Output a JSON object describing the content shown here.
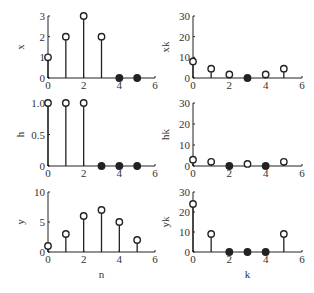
{
  "figure": {
    "background": "#ffffff",
    "stem_color": "#222222"
  },
  "chart_data": [
    {
      "type": "stem",
      "title": "",
      "xlabel": "",
      "ylabel": "x",
      "x": [
        0,
        1,
        2,
        3,
        4,
        5
      ],
      "values": [
        1,
        2,
        3,
        2,
        0,
        0
      ],
      "xlim": [
        0,
        6
      ],
      "ylim": [
        0,
        3
      ],
      "xticks": [
        "0",
        "2",
        "4",
        "6"
      ],
      "yticks": [
        "0",
        "1",
        "2",
        "3"
      ],
      "filled_markers": [
        4,
        5
      ],
      "grid": false
    },
    {
      "type": "stem",
      "title": "",
      "xlabel": "",
      "ylabel": "xk",
      "x": [
        0,
        1,
        2,
        3,
        4,
        5
      ],
      "values": [
        8,
        4.5,
        1.7,
        0,
        1.7,
        4.5
      ],
      "xlim": [
        0,
        6
      ],
      "ylim": [
        0,
        30
      ],
      "xticks": [
        "0",
        "2",
        "4",
        "6"
      ],
      "yticks": [
        "0",
        "10",
        "20",
        "30"
      ],
      "filled_markers": [
        3
      ],
      "grid": false
    },
    {
      "type": "stem",
      "title": "",
      "xlabel": "",
      "ylabel": "h",
      "x": [
        0,
        1,
        2,
        3,
        4,
        5
      ],
      "values": [
        1,
        1,
        1,
        0,
        0,
        0
      ],
      "xlim": [
        0,
        6
      ],
      "ylim": [
        0,
        1
      ],
      "xticks": [
        "0",
        "2",
        "4",
        "6"
      ],
      "yticks": [
        "0",
        "0.5",
        "1.0"
      ],
      "filled_markers": [
        3,
        4,
        5
      ],
      "grid": false
    },
    {
      "type": "stem",
      "title": "",
      "xlabel": "",
      "ylabel": "hk",
      "x": [
        0,
        1,
        2,
        3,
        4,
        5
      ],
      "values": [
        3,
        2,
        0,
        1,
        0,
        2
      ],
      "xlim": [
        0,
        6
      ],
      "ylim": [
        0,
        30
      ],
      "xticks": [
        "0",
        "2",
        "4",
        "6"
      ],
      "yticks": [
        "0",
        "10",
        "20",
        "30"
      ],
      "filled_markers": [
        2,
        4
      ],
      "grid": false
    },
    {
      "type": "stem",
      "title": "",
      "xlabel": "n",
      "ylabel": "y",
      "x": [
        0,
        1,
        2,
        3,
        4,
        5
      ],
      "values": [
        1,
        3,
        6,
        7,
        5,
        2
      ],
      "xlim": [
        0,
        6
      ],
      "ylim": [
        0,
        10
      ],
      "xticks": [
        "0",
        "2",
        "4",
        "6"
      ],
      "yticks": [
        "0",
        "5",
        "10"
      ],
      "filled_markers": [],
      "grid": false
    },
    {
      "type": "stem",
      "title": "",
      "xlabel": "k",
      "ylabel": "yk",
      "x": [
        0,
        1,
        2,
        3,
        4,
        5
      ],
      "values": [
        24,
        9,
        0,
        0,
        0,
        9
      ],
      "xlim": [
        0,
        6
      ],
      "ylim": [
        0,
        30
      ],
      "xticks": [
        "0",
        "2",
        "4",
        "6"
      ],
      "yticks": [
        "0",
        "10",
        "20",
        "30"
      ],
      "filled_markers": [
        2,
        3,
        4
      ],
      "grid": false
    }
  ],
  "layout": [
    {
      "x0": 48,
      "x1": 155,
      "y0": 78,
      "y1": 16
    },
    {
      "x0": 193,
      "x1": 302,
      "y0": 78,
      "y1": 16
    },
    {
      "x0": 48,
      "x1": 155,
      "y0": 166,
      "y1": 103
    },
    {
      "x0": 193,
      "x1": 302,
      "y0": 166,
      "y1": 103
    },
    {
      "x0": 48,
      "x1": 155,
      "y0": 252,
      "y1": 192
    },
    {
      "x0": 193,
      "x1": 302,
      "y0": 252,
      "y1": 192
    }
  ]
}
